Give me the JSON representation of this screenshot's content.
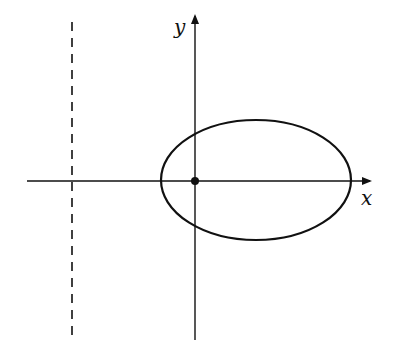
{
  "diagram": {
    "type": "ellipse-with-directrix",
    "axes": {
      "x_label": "x",
      "y_label": "y",
      "origin": {
        "px": 195,
        "py": 181
      }
    },
    "ellipse": {
      "cx": 256,
      "cy": 180,
      "rx": 95,
      "ry": 60
    },
    "focus_point": {
      "px": 195,
      "py": 181
    },
    "directrix": {
      "px": 72,
      "style": "dashed"
    },
    "colors": {
      "stroke": "#111111",
      "background": "#ffffff"
    }
  }
}
